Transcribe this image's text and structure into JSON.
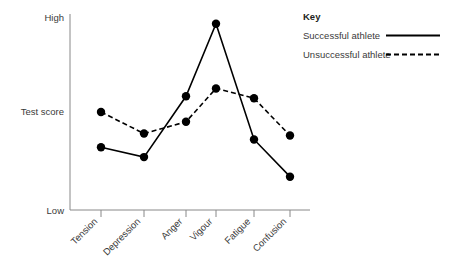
{
  "chart_data": {
    "type": "line",
    "title": "",
    "xlabel": "",
    "ylabel": "Test score",
    "categories": [
      "Tension",
      "Depression",
      "Anger",
      "Vigour",
      "Fatigue",
      "Confusion"
    ],
    "ylim": [
      0,
      100
    ],
    "ytick_labels": [
      "Low",
      "High"
    ],
    "grid": false,
    "legend_position": "top-right",
    "legend_title": "Key",
    "series": [
      {
        "name": "Successful athlete",
        "style": "solid",
        "values": [
          32,
          27,
          58,
          95,
          36,
          17
        ]
      },
      {
        "name": "Unsuccessful athlete",
        "style": "dashed",
        "values": [
          50,
          39,
          45,
          62,
          57,
          38
        ]
      }
    ]
  },
  "axes": {
    "y_high_label": "High",
    "y_low_label": "Low",
    "y_axis_title": "Test score"
  },
  "legend": {
    "title": "Key",
    "entries": [
      {
        "label": "Successful athlete",
        "style": "solid"
      },
      {
        "label": "Unsuccessful athlete",
        "style": "dashed"
      }
    ]
  },
  "colors": {
    "series_line": "#000000",
    "axis": "#888888",
    "text": "#3a3a3a",
    "background": "#ffffff"
  }
}
